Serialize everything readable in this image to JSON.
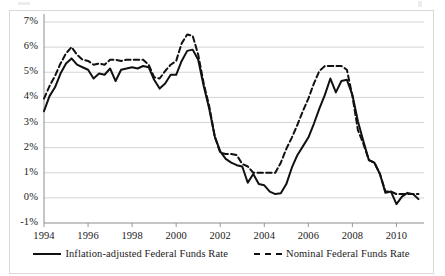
{
  "chart_data": {
    "type": "line",
    "title": "",
    "xlabel": "",
    "ylabel": "",
    "xlim": [
      1994,
      2011.25
    ],
    "ylim": [
      -1,
      7
    ],
    "ytick_labels": [
      "7%",
      "6%",
      "5%",
      "4%",
      "3%",
      "2%",
      "1%",
      "0%",
      "-1%"
    ],
    "ytick_values": [
      7,
      6,
      5,
      4,
      3,
      2,
      1,
      0,
      -1
    ],
    "xtick_labels": [
      "1994",
      "1996",
      "1998",
      "2000",
      "2002",
      "2004",
      "2006",
      "2008",
      "2010"
    ],
    "xtick_values": [
      1994,
      1996,
      1998,
      2000,
      2002,
      2004,
      2006,
      2008,
      2010
    ],
    "grid": "horizontal",
    "legend_position": "bottom",
    "series": [
      {
        "name": "Inflation-adjusted Federal Funds Rate",
        "style": "solid",
        "color": "#111111",
        "x": [
          1994.0,
          1994.25,
          1994.5,
          1994.75,
          1995.0,
          1995.25,
          1995.5,
          1995.75,
          1996.0,
          1996.25,
          1996.5,
          1996.75,
          1997.0,
          1997.25,
          1997.5,
          1997.75,
          1998.0,
          1998.25,
          1998.5,
          1998.75,
          1999.0,
          1999.25,
          1999.5,
          1999.75,
          2000.0,
          2000.25,
          2000.5,
          2000.75,
          2001.0,
          2001.25,
          2001.5,
          2001.75,
          2002.0,
          2002.25,
          2002.5,
          2002.75,
          2003.0,
          2003.25,
          2003.5,
          2003.75,
          2004.0,
          2004.25,
          2004.5,
          2004.75,
          2005.0,
          2005.25,
          2005.5,
          2005.75,
          2006.0,
          2006.25,
          2006.5,
          2006.75,
          2007.0,
          2007.25,
          2007.5,
          2007.75,
          2008.0,
          2008.25,
          2008.5,
          2008.75,
          2009.0,
          2009.25,
          2009.5,
          2009.75,
          2010.0,
          2010.25,
          2010.5,
          2010.75,
          2011.0
        ],
        "y": [
          3.45,
          4.05,
          4.4,
          4.95,
          5.35,
          5.55,
          5.3,
          5.2,
          5.1,
          4.75,
          4.95,
          4.9,
          5.15,
          4.65,
          5.1,
          5.15,
          5.2,
          5.15,
          5.25,
          5.2,
          4.7,
          4.35,
          4.55,
          4.9,
          4.9,
          5.45,
          5.85,
          5.9,
          5.5,
          4.45,
          3.55,
          2.45,
          1.85,
          1.55,
          1.4,
          1.3,
          1.25,
          0.6,
          0.95,
          0.55,
          0.5,
          0.25,
          0.15,
          0.18,
          0.55,
          1.2,
          1.7,
          2.05,
          2.4,
          2.95,
          3.55,
          4.1,
          4.75,
          4.2,
          4.65,
          4.7,
          4.1,
          3.05,
          2.25,
          1.5,
          1.4,
          0.95,
          0.2,
          0.25,
          -0.25,
          0.05,
          0.2,
          0.15,
          -0.05
        ]
      },
      {
        "name": "Nominal Federal Funds Rate",
        "style": "dashed",
        "color": "#111111",
        "x": [
          1994.0,
          1994.25,
          1994.5,
          1994.75,
          1995.0,
          1995.25,
          1995.5,
          1995.75,
          1996.0,
          1996.25,
          1996.5,
          1996.75,
          1997.0,
          1997.25,
          1997.5,
          1997.75,
          1998.0,
          1998.25,
          1998.5,
          1998.75,
          1999.0,
          1999.25,
          1999.5,
          1999.75,
          2000.0,
          2000.25,
          2000.5,
          2000.75,
          2001.0,
          2001.25,
          2001.5,
          2001.75,
          2002.0,
          2002.25,
          2002.5,
          2002.75,
          2003.0,
          2003.25,
          2003.5,
          2003.75,
          2004.0,
          2004.25,
          2004.5,
          2004.75,
          2005.0,
          2005.25,
          2005.5,
          2005.75,
          2006.0,
          2006.25,
          2006.5,
          2006.75,
          2007.0,
          2007.25,
          2007.5,
          2007.75,
          2008.0,
          2008.25,
          2008.5,
          2008.75,
          2009.0,
          2009.25,
          2009.5,
          2009.75,
          2010.0,
          2010.25,
          2010.5,
          2010.75,
          2011.0
        ],
        "y": [
          3.95,
          4.45,
          4.85,
          5.35,
          5.75,
          6.0,
          5.7,
          5.5,
          5.45,
          5.3,
          5.35,
          5.3,
          5.5,
          5.5,
          5.45,
          5.5,
          5.5,
          5.5,
          5.5,
          5.3,
          4.8,
          4.75,
          5.05,
          5.3,
          5.45,
          6.15,
          6.5,
          6.45,
          5.7,
          4.55,
          3.65,
          2.45,
          1.8,
          1.75,
          1.75,
          1.7,
          1.35,
          1.25,
          1.0,
          1.0,
          1.0,
          1.0,
          1.0,
          1.4,
          1.95,
          2.4,
          2.9,
          3.45,
          3.95,
          4.55,
          5.05,
          5.25,
          5.25,
          5.25,
          5.25,
          5.1,
          4.05,
          2.7,
          2.15,
          1.5,
          1.4,
          0.95,
          0.25,
          0.25,
          0.15,
          0.15,
          0.15,
          0.15,
          0.15
        ]
      }
    ]
  },
  "legend": {
    "items": [
      {
        "label": "Inflation-adjusted Federal Funds Rate",
        "style": "solid"
      },
      {
        "label": "Nominal Federal Funds Rate",
        "style": "dashed"
      }
    ]
  }
}
